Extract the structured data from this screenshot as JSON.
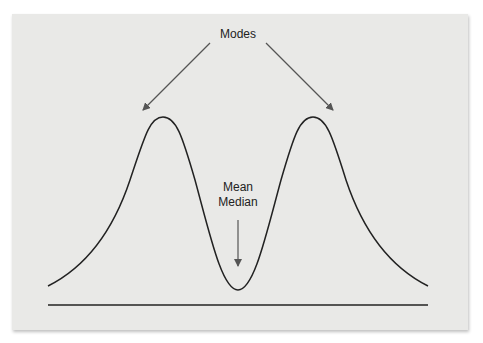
{
  "diagram": {
    "labels": {
      "modes": "Modes",
      "mean": "Mean",
      "median": "Median"
    },
    "colors": {
      "background": "#e9e9e7",
      "curve": "#222222",
      "arrow": "#555555"
    }
  }
}
